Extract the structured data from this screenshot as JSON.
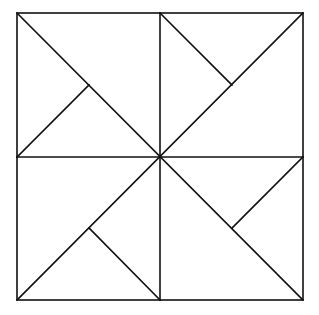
{
  "diagram": {
    "type": "quilt-block-pinwheel",
    "stroke_color": "#111111",
    "background": "#ffffff",
    "outer_square": {
      "x1": 17,
      "y1": 13,
      "x2": 303,
      "y2": 300
    },
    "center": {
      "x": 160,
      "y": 157
    },
    "lines": [
      {
        "id": "mid-vertical",
        "x1": 160,
        "y1": 13,
        "x2": 160,
        "y2": 300
      },
      {
        "id": "mid-horizontal",
        "x1": 17,
        "y1": 157,
        "x2": 303,
        "y2": 157
      },
      {
        "id": "diag-tl-br",
        "x1": 17,
        "y1": 13,
        "x2": 303,
        "y2": 300
      },
      {
        "id": "diag-tr-bl",
        "x1": 303,
        "y1": 13,
        "x2": 17,
        "y2": 300
      },
      {
        "id": "tl-inner",
        "x1": 17,
        "y1": 157,
        "x2": 89,
        "y2": 85
      },
      {
        "id": "tr-inner",
        "x1": 160,
        "y1": 13,
        "x2": 232,
        "y2": 85
      },
      {
        "id": "bl-inner",
        "x1": 160,
        "y1": 300,
        "x2": 89,
        "y2": 228
      },
      {
        "id": "br-inner",
        "x1": 303,
        "y1": 157,
        "x2": 232,
        "y2": 228
      }
    ]
  }
}
